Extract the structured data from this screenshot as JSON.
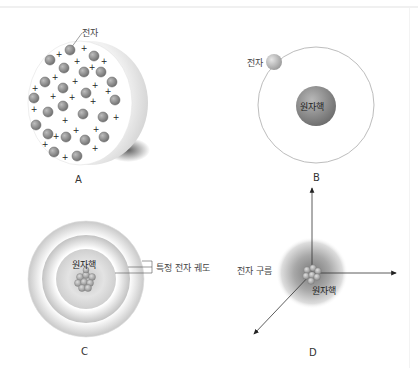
{
  "diagram": {
    "panels": [
      {
        "id": "A",
        "caption": "A",
        "model": "plum-pudding",
        "labels": {
          "electron": "전자"
        },
        "electron_sign": "−",
        "proton_sign": "+"
      },
      {
        "id": "B",
        "caption": "B",
        "model": "planetary",
        "labels": {
          "electron": "전자",
          "nucleus": "원자핵"
        }
      },
      {
        "id": "C",
        "caption": "C",
        "model": "bohr-shells",
        "labels": {
          "nucleus": "원자핵",
          "orbit": "특정 전자 궤도"
        }
      },
      {
        "id": "D",
        "caption": "D",
        "model": "electron-cloud",
        "labels": {
          "cloud": "전자 구름",
          "nucleus": "원자핵"
        }
      }
    ],
    "colors": {
      "electron_fill": "#8a8a8a",
      "sphere_shadow": "#bdbdbd",
      "nucleus": "#7a7a7a",
      "orbit_line": "#b5b5b5",
      "axis": "#333333"
    }
  }
}
